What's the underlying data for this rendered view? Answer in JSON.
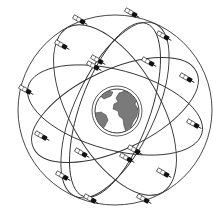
{
  "diagram": {
    "colors": {
      "background": "#ffffff",
      "orbit_stroke": "#333333",
      "earth_ocean": "#ffffff",
      "earth_land": "#7a7a7a",
      "earth_outline": "#333333",
      "satellite_body": "#111111",
      "satellite_panel": "#ffffff"
    },
    "earth": {
      "cx": 117,
      "cy": 111,
      "r": 22
    },
    "orbits": [
      {
        "cx": 115,
        "cy": 110,
        "rx": 90,
        "ry": 40,
        "rotate": 15
      },
      {
        "cx": 115,
        "cy": 110,
        "rx": 90,
        "ry": 40,
        "rotate": -25
      },
      {
        "cx": 115,
        "cy": 110,
        "rx": 95,
        "ry": 45,
        "rotate": 60
      },
      {
        "cx": 115,
        "cy": 110,
        "rx": 95,
        "ry": 40,
        "rotate": -65
      },
      {
        "cx": 115,
        "cy": 110,
        "rx": 97,
        "ry": 95,
        "rotate": 0
      },
      {
        "cx": 115,
        "cy": 110,
        "rx": 92,
        "ry": 35,
        "rotate": 110
      }
    ],
    "satellites": [
      {
        "x": 83,
        "y": 22
      },
      {
        "x": 135,
        "y": 15
      },
      {
        "x": 167,
        "y": 38
      },
      {
        "x": 65,
        "y": 47
      },
      {
        "x": 101,
        "y": 62
      },
      {
        "x": 97,
        "y": 68
      },
      {
        "x": 152,
        "y": 64
      },
      {
        "x": 190,
        "y": 80
      },
      {
        "x": 29,
        "y": 92
      },
      {
        "x": 197,
        "y": 126
      },
      {
        "x": 45,
        "y": 138
      },
      {
        "x": 85,
        "y": 155
      },
      {
        "x": 138,
        "y": 152
      },
      {
        "x": 130,
        "y": 160
      },
      {
        "x": 167,
        "y": 175
      },
      {
        "x": 66,
        "y": 178
      },
      {
        "x": 94,
        "y": 201
      },
      {
        "x": 147,
        "y": 201
      }
    ]
  }
}
